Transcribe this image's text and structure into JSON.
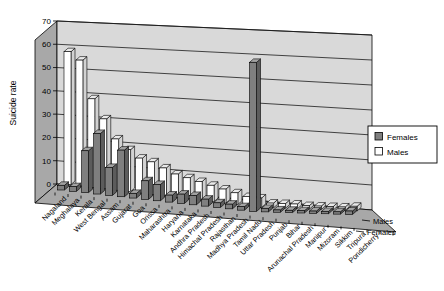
{
  "chart_data": {
    "type": "bar",
    "projection": "3d-column",
    "title": "",
    "ylabel": "Suicide rate",
    "xlabel": "",
    "ylim": [
      0,
      70
    ],
    "yticks": [
      0,
      10,
      20,
      30,
      40,
      50,
      60,
      70
    ],
    "grid": "on",
    "legend_position": "right",
    "categories": [
      "Nagaland",
      "Meghalaya",
      "Kerala",
      "West Bengal",
      "Assam",
      "Gujarat",
      "Goa",
      "Orissa",
      "Maharashtra",
      "Haryana",
      "Karnataka",
      "Andhra Pradesh",
      "Himachal Pradesh",
      "Rajasthan",
      "Madhya Pradesh",
      "Tamil Nadu",
      "Uttar Pradesh",
      "Punjab",
      "Bihar",
      "Arunachal Pradesh",
      "Manipur",
      "Mizoram",
      "Sikkim",
      "Tripura",
      "Pondicherry"
    ],
    "series": [
      {
        "name": "Females",
        "row": "front",
        "values": [
          2,
          2,
          18,
          26,
          12,
          20,
          2,
          8,
          7,
          3,
          4,
          4,
          3,
          2,
          2,
          1.5,
          64,
          1.5,
          1,
          1,
          1,
          1,
          1,
          1,
          1.5
        ]
      },
      {
        "name": "Males",
        "row": "back",
        "values": [
          57,
          54,
          38,
          30,
          22,
          18,
          15,
          14,
          12,
          10,
          9,
          8,
          7,
          6,
          5,
          4,
          4,
          2,
          2,
          2,
          1.5,
          1.5,
          1.5,
          1.5,
          2
        ]
      }
    ],
    "series_axis_labels": [
      "Males",
      "Females"
    ],
    "legend": {
      "entries": [
        "Females",
        "Males"
      ]
    },
    "colors": {
      "females_front": "#7f7f7f",
      "females_top": "#a3a3a3",
      "females_side": "#5c5c5c",
      "males_front": "#ffffff",
      "males_top": "#e9e9e9",
      "males_side": "#d2d2d2",
      "back_wall": "#d9d9d9",
      "side_wall": "#a8a8a8",
      "floor": "#a8a8a8",
      "outline": "#000000",
      "gridline": "#1a1a1a",
      "background": "#ffffff"
    }
  }
}
